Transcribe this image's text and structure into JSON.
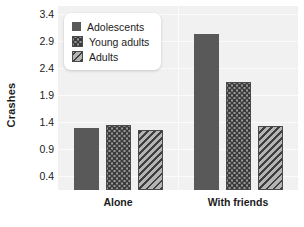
{
  "chart_data": {
    "type": "bar",
    "title": "",
    "xlabel": "",
    "ylabel": "Crashes",
    "categories": [
      "Alone",
      "With friends"
    ],
    "series": [
      {
        "name": "Adolescents",
        "pattern": "solid",
        "color": "#595959",
        "values": [
          1.3,
          3.03
        ]
      },
      {
        "name": "Young adults",
        "pattern": "dots",
        "color": "#9a9a9a",
        "values": [
          1.36,
          2.15
        ]
      },
      {
        "name": "Adults",
        "pattern": "diag",
        "color": "#8f8f8f",
        "values": [
          1.26,
          1.34
        ]
      }
    ],
    "ylim": [
      0.15,
      3.55
    ],
    "yticks": [
      0.4,
      0.9,
      1.4,
      1.9,
      2.4,
      2.9,
      3.4
    ],
    "ytick_labels": [
      "0.4",
      "0.9",
      "1.4",
      "1.9",
      "2.4",
      "2.9",
      "3.4"
    ],
    "grid": true,
    "legend_position": "top-left",
    "plot_background": "#f1f1f1",
    "gridline_color": "#fbfbfb"
  },
  "legend": {
    "items": [
      {
        "label": "Adolescents"
      },
      {
        "label": "Young adults"
      },
      {
        "label": "Adults"
      }
    ]
  }
}
